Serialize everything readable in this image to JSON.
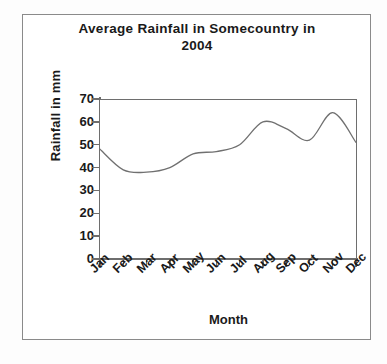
{
  "chart_data": {
    "type": "line",
    "title": "Average Rainfall in Somecountry in 2004",
    "title_line1": "Average Rainfall in Somecountry in",
    "title_line2": "2004",
    "xlabel": "Month",
    "ylabel": "Rainfall in mm",
    "categories": [
      "Jan",
      "Feb",
      "Mar",
      "Apr",
      "May",
      "Jun",
      "Jul",
      "Aug",
      "Sep",
      "Oct",
      "Nov",
      "Dec"
    ],
    "values": [
      48,
      39,
      38,
      40,
      46,
      47,
      50,
      60,
      57,
      52,
      64,
      51
    ],
    "series": [
      {
        "name": "Average rainfall",
        "values": [
          48,
          39,
          38,
          40,
          46,
          47,
          50,
          60,
          57,
          52,
          64,
          51
        ],
        "color": "#707070"
      }
    ],
    "yticks": [
      0,
      10,
      20,
      30,
      40,
      50,
      60,
      70
    ],
    "ytick_labels": [
      "0",
      "10",
      "20",
      "30",
      "40",
      "50",
      "60",
      "70"
    ],
    "ylim": [
      0,
      70
    ],
    "xlim": [
      0,
      11
    ],
    "grid": false,
    "legend": false,
    "line_color": "#707070",
    "frame_color": "#6e6e6e",
    "text_color": "#1a1a1a",
    "background": "#ffffff"
  }
}
